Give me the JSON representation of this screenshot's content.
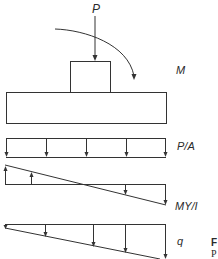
{
  "diagram": {
    "labels": {
      "load": "P",
      "moment": "M",
      "axial_stress": "P/A",
      "bending_stress": "MY/I",
      "resultant_pressure": "q"
    },
    "caption_fragment": {
      "line1": "F",
      "line2": "P"
    },
    "colors": {
      "stroke": "#333333",
      "background": "#ffffff"
    }
  }
}
